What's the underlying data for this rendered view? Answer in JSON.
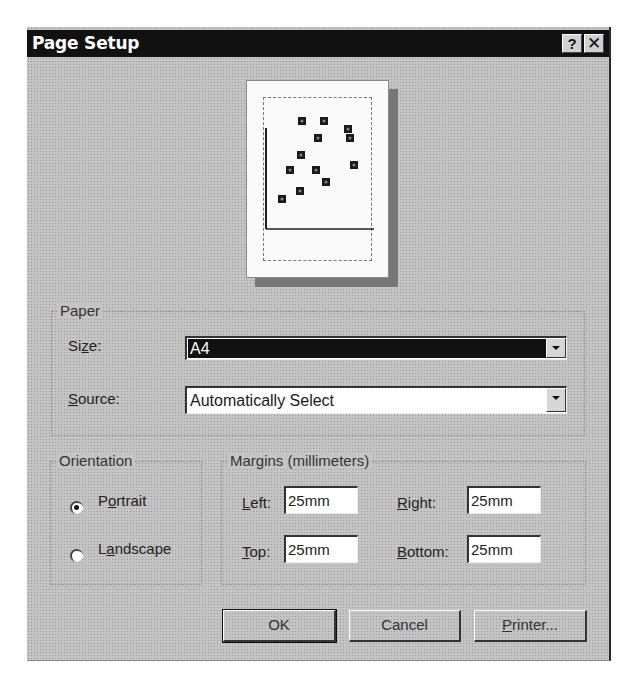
{
  "window": {
    "title": "Page Setup",
    "help_label": "?",
    "close_label": "✕"
  },
  "preview": {
    "points": [
      {
        "x": 55,
        "y": 40
      },
      {
        "x": 77,
        "y": 40
      },
      {
        "x": 101,
        "y": 48
      },
      {
        "x": 71,
        "y": 57
      },
      {
        "x": 103,
        "y": 57
      },
      {
        "x": 54,
        "y": 74
      },
      {
        "x": 43,
        "y": 89
      },
      {
        "x": 69,
        "y": 89
      },
      {
        "x": 107,
        "y": 84
      },
      {
        "x": 79,
        "y": 101
      },
      {
        "x": 53,
        "y": 110
      },
      {
        "x": 35,
        "y": 118
      }
    ]
  },
  "paper": {
    "group_label": "Paper",
    "size_label": "Size:",
    "size_value": "A4",
    "source_label": "Source:",
    "source_value": "Automatically Select"
  },
  "orientation": {
    "group_label": "Orientation",
    "portrait_label": "Portrait",
    "landscape_label": "Landscape",
    "selected": "Portrait"
  },
  "margins": {
    "group_label": "Margins (millimeters)",
    "left_label": "Left:",
    "left_value": "25mm",
    "right_label": "Right:",
    "right_value": "25mm",
    "top_label": "Top:",
    "top_value": "25mm",
    "bottom_label": "Bottom:",
    "bottom_value": "25mm"
  },
  "buttons": {
    "ok": "OK",
    "cancel": "Cancel",
    "printer": "Printer..."
  }
}
